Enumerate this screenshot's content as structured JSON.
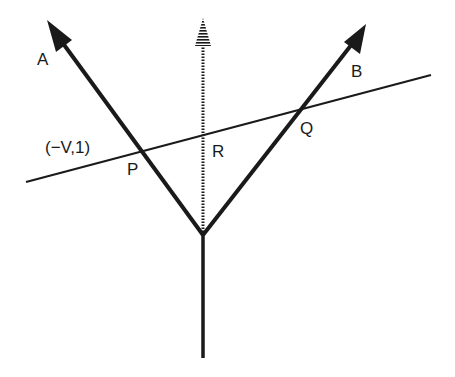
{
  "diagram": {
    "labels": {
      "A": "A",
      "B": "B",
      "P": "P",
      "Q": "Q",
      "R": "R",
      "coord": "(−V,1)"
    },
    "colors": {
      "stroke": "#1a1a1a",
      "background": "#ffffff"
    },
    "elements": [
      {
        "id": "ray-A",
        "type": "solid-arrow",
        "from": [
          203,
          235
        ],
        "to": [
          47,
          20
        ]
      },
      {
        "id": "ray-B",
        "type": "solid-arrow",
        "from": [
          203,
          235
        ],
        "to": [
          366,
          24
        ]
      },
      {
        "id": "ray-center",
        "type": "dotted-arrow",
        "from": [
          203,
          235
        ],
        "to": [
          203,
          18
        ]
      },
      {
        "id": "stem",
        "type": "line",
        "from": [
          203,
          235
        ],
        "to": [
          203,
          358
        ]
      },
      {
        "id": "cut-line",
        "type": "line",
        "from": [
          26,
          182
        ],
        "to": [
          431,
          75
        ]
      }
    ]
  }
}
